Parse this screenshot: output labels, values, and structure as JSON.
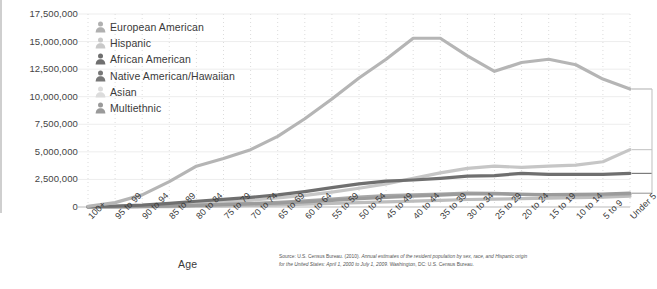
{
  "axis": {
    "x_title": "Age",
    "y_ticks": [
      "17,500,000",
      "15,000,000",
      "12,500,000",
      "10,000,000",
      "7,500,000",
      "5,000,000",
      "2,500,000",
      "0"
    ]
  },
  "legend": {
    "items": [
      {
        "label": "European American",
        "color": "#b0b0b0",
        "icon": "person-icon"
      },
      {
        "label": "Hispanic",
        "color": "#c9c9c9",
        "icon": "person-icon"
      },
      {
        "label": "African American",
        "color": "#6f6f6f",
        "icon": "person-icon"
      },
      {
        "label": "Native American/Hawaiian",
        "color": "#787878",
        "icon": "person-icon"
      },
      {
        "label": "Asian",
        "color": "#dcdcdc",
        "icon": "person-icon"
      },
      {
        "label": "Multiethnic",
        "color": "#9a9a9a",
        "icon": "person-icon"
      }
    ]
  },
  "source": {
    "line1_head": "Source: U.S. Census Bureau. (2010). ",
    "line1_ital": "Annual estimates of the resident population by sex, race, and Hispanic origin for the United States:",
    "line2_ital": "April 1, 2000 to July 1, 2009. ",
    "line2_head": "Washington, DC: U.S. Census Bureau."
  },
  "chart_data": {
    "type": "line",
    "title": "",
    "xlabel": "Age",
    "ylabel": "",
    "ylim": [
      0,
      17500000
    ],
    "ytick_step": 2500000,
    "grid": true,
    "legend_position": "top-left",
    "categories": [
      "100+",
      "95 to 99",
      "90 to 94",
      "85 to 89",
      "80 to 84",
      "75 to 79",
      "70 to 74",
      "65 to 69",
      "60 to 64",
      "55 to 59",
      "50 to 54",
      "45 to 49",
      "40 to 44",
      "35 to 39",
      "30 to 34",
      "25 to 29",
      "20 to 24",
      "15 to 19",
      "10 to 14",
      "5 to 9",
      "Under 5"
    ],
    "series": [
      {
        "name": "European American",
        "color": "#b5b5b5",
        "values": [
          60000,
          400000,
          1100000,
          2300000,
          3700000,
          4400000,
          5200000,
          6400000,
          8000000,
          9800000,
          11700000,
          13400000,
          15300000,
          15300000,
          13700000,
          12300000,
          13100000,
          13400000,
          12900000,
          11600000,
          10700000
        ]
      },
      {
        "name": "Hispanic",
        "color": "#c6c6c6",
        "values": [
          20000,
          60000,
          120000,
          220000,
          350000,
          480000,
          620000,
          820000,
          1050000,
          1350000,
          1700000,
          2100000,
          2600000,
          3100000,
          3500000,
          3700000,
          3600000,
          3700000,
          3800000,
          4100000,
          5200000
        ]
      },
      {
        "name": "African American",
        "color": "#6f6f6f",
        "values": [
          25000,
          80000,
          170000,
          320000,
          520000,
          700000,
          880000,
          1100000,
          1400000,
          1750000,
          2100000,
          2350000,
          2450000,
          2600000,
          2800000,
          2850000,
          3050000,
          2950000,
          2950000,
          2950000,
          3050000
        ]
      },
      {
        "name": "Native American/Hawaiian",
        "color": "#9b9b9b",
        "values": [
          8000,
          25000,
          55000,
          95000,
          150000,
          210000,
          280000,
          360000,
          470000,
          600000,
          750000,
          880000,
          980000,
          1080000,
          1180000,
          1200000,
          1150000,
          1120000,
          1150000,
          1180000,
          1250000
        ]
      },
      {
        "name": "Asian",
        "color": "#a8a8a8",
        "values": [
          5000,
          18000,
          42000,
          85000,
          150000,
          230000,
          320000,
          430000,
          560000,
          720000,
          900000,
          1030000,
          1100000,
          1180000,
          1250000,
          1230000,
          1150000,
          1100000,
          1100000,
          1120000,
          1180000
        ]
      },
      {
        "name": "Multiethnic",
        "color": "#bdbdbd",
        "values": [
          3000,
          10000,
          22000,
          42000,
          70000,
          100000,
          140000,
          190000,
          250000,
          320000,
          400000,
          470000,
          530000,
          600000,
          680000,
          720000,
          760000,
          800000,
          850000,
          900000,
          980000
        ]
      }
    ]
  }
}
